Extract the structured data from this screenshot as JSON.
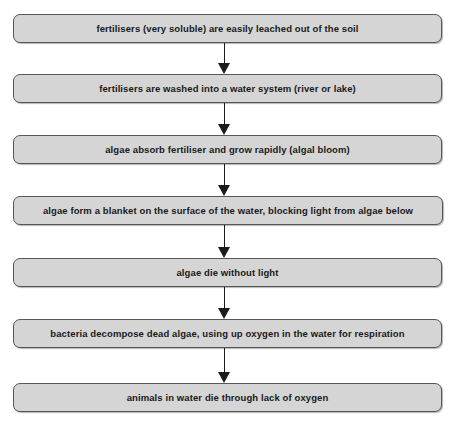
{
  "diagram": {
    "orientation": "vertical top-to-bottom",
    "background_color": "#ffffff",
    "box_fill_color": "#d5d5d5",
    "box_border_color": "#575757",
    "text_color": "#1a1a1a",
    "arrow_color": "#1b1b1b",
    "steps": [
      {
        "index": 1,
        "label": "fertilisers (very soluble) are easily leached out of the soil",
        "x": 13,
        "y": 14,
        "width": 429,
        "height": 29
      },
      {
        "index": 2,
        "label": "fertilisers are washed into a water system (river or lake)",
        "x": 13,
        "y": 74,
        "width": 429,
        "height": 29
      },
      {
        "index": 3,
        "label": "algae absorb fertiliser and grow rapidly (algal bloom)",
        "x": 13,
        "y": 135,
        "width": 429,
        "height": 29
      },
      {
        "index": 4,
        "label": "algae form a blanket on the surface of the water, blocking light from algae below",
        "x": 13,
        "y": 196,
        "width": 430,
        "height": 29
      },
      {
        "index": 5,
        "label": "algae die without light",
        "x": 13,
        "y": 258,
        "width": 429,
        "height": 29
      },
      {
        "index": 6,
        "label": "bacteria decompose dead algae, using up oxygen in the water for respiration",
        "x": 13,
        "y": 319,
        "width": 429,
        "height": 29
      },
      {
        "index": 7,
        "label": "animals in water die through lack of oxygen",
        "x": 13,
        "y": 383,
        "width": 429,
        "height": 29
      }
    ],
    "connectors": [
      {
        "index": 1,
        "from_step": 1,
        "to_step": 2,
        "center_x": 224,
        "top": 43,
        "height": 31
      },
      {
        "index": 2,
        "from_step": 2,
        "to_step": 3,
        "center_x": 224,
        "top": 103,
        "height": 32
      },
      {
        "index": 3,
        "from_step": 3,
        "to_step": 4,
        "center_x": 224,
        "top": 164,
        "height": 32
      },
      {
        "index": 4,
        "from_step": 4,
        "to_step": 5,
        "center_x": 224,
        "top": 225,
        "height": 33
      },
      {
        "index": 5,
        "from_step": 5,
        "to_step": 6,
        "center_x": 224,
        "top": 287,
        "height": 32
      },
      {
        "index": 6,
        "from_step": 6,
        "to_step": 7,
        "center_x": 224,
        "top": 348,
        "height": 35
      }
    ],
    "caption": ""
  }
}
